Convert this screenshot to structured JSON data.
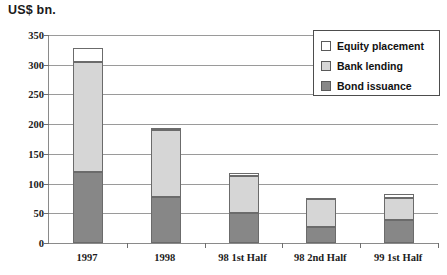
{
  "chart_data": {
    "type": "bar",
    "stacked": true,
    "title": "US$ bn.",
    "xlabel": "",
    "ylabel": "",
    "ylim": [
      0,
      350
    ],
    "yticks": [
      0,
      50,
      100,
      150,
      200,
      250,
      300,
      350
    ],
    "grid": true,
    "legend_position": "top-right",
    "categories": [
      "1997",
      "1998",
      "98 1st Half",
      "98 2nd Half",
      "99 1st Half"
    ],
    "series": [
      {
        "name": "Bond issuance",
        "color": "#878787",
        "values": [
          120,
          77,
          50,
          27,
          38
        ]
      },
      {
        "name": "Bank lending",
        "color": "#d6d6d6",
        "values": [
          185,
          113,
          63,
          47,
          38
        ]
      },
      {
        "name": "Equity placement",
        "color": "#ffffff",
        "values": [
          23,
          4,
          4,
          2,
          7
        ]
      }
    ],
    "totals": [
      328,
      194,
      117,
      76,
      83
    ]
  },
  "legend": {
    "items": [
      {
        "label": "Equity placement",
        "swatch": "equity"
      },
      {
        "label": "Bank lending",
        "swatch": "bank"
      },
      {
        "label": "Bond issuance",
        "swatch": "bond"
      }
    ]
  }
}
